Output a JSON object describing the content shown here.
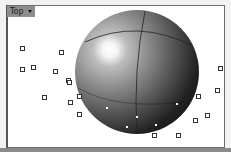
{
  "viewport": {
    "title": "Top",
    "dropdown_icon": "triangle-down-icon",
    "background": "#ffffff"
  },
  "object": {
    "type": "sphere",
    "shading": "rendered-gray"
  },
  "control_points": [
    [
      22,
      48
    ],
    [
      61,
      52
    ],
    [
      22,
      69
    ],
    [
      33,
      67
    ],
    [
      55,
      71
    ],
    [
      68,
      80
    ],
    [
      69,
      82
    ],
    [
      44,
      97
    ],
    [
      70,
      102
    ],
    [
      79,
      96
    ],
    [
      79,
      114
    ],
    [
      220,
      68
    ],
    [
      217,
      90
    ],
    [
      198,
      96
    ],
    [
      207,
      115
    ],
    [
      195,
      120
    ],
    [
      154,
      135
    ],
    [
      178,
      135
    ]
  ],
  "surface_points": [
    [
      107,
      108
    ],
    [
      137,
      117
    ],
    [
      127,
      127
    ],
    [
      156,
      125
    ],
    [
      177,
      104
    ]
  ]
}
